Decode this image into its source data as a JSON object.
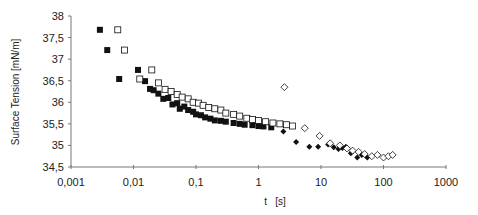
{
  "chart_data": {
    "type": "scatter",
    "title": "",
    "xlabel": "t   [s]",
    "ylabel": "Surface Tension [mN/m]",
    "xscale": "log",
    "xlim": [
      0.001,
      1000
    ],
    "ylim": [
      34.5,
      38
    ],
    "x_ticks": [
      "0,001",
      "0,01",
      "0,1",
      "1",
      "10",
      "100",
      "1000"
    ],
    "x_tick_values": [
      0.001,
      0.01,
      0.1,
      1,
      10,
      100,
      1000
    ],
    "y_ticks": [
      "34,5",
      "35",
      "35,5",
      "36",
      "36,5",
      "37",
      "37,5",
      "38"
    ],
    "y_tick_values": [
      34.5,
      35,
      35.5,
      36,
      36.5,
      37,
      37.5,
      38
    ],
    "grid": false,
    "legend": null,
    "series": [
      {
        "name": "filled-squares",
        "marker": "square-filled",
        "color": "#111111",
        "points": [
          [
            0.0029,
            37.68
          ],
          [
            0.0038,
            37.21
          ],
          [
            0.0059,
            36.54
          ],
          [
            0.0118,
            36.75
          ],
          [
            0.0153,
            36.49
          ],
          [
            0.0184,
            36.31
          ],
          [
            0.021,
            36.28
          ],
          [
            0.025,
            36.2
          ],
          [
            0.03,
            36.08
          ],
          [
            0.036,
            36.1
          ],
          [
            0.042,
            35.95
          ],
          [
            0.05,
            35.98
          ],
          [
            0.055,
            35.85
          ],
          [
            0.065,
            35.9
          ],
          [
            0.075,
            35.82
          ],
          [
            0.09,
            35.78
          ],
          [
            0.1,
            35.72
          ],
          [
            0.12,
            35.7
          ],
          [
            0.14,
            35.65
          ],
          [
            0.17,
            35.62
          ],
          [
            0.2,
            35.58
          ],
          [
            0.25,
            35.57
          ],
          [
            0.3,
            35.55
          ],
          [
            0.4,
            35.52
          ],
          [
            0.5,
            35.5
          ],
          [
            0.6,
            35.48
          ],
          [
            0.8,
            35.47
          ],
          [
            1.0,
            35.45
          ],
          [
            1.2,
            35.44
          ],
          [
            1.6,
            35.42
          ]
        ]
      },
      {
        "name": "open-squares",
        "marker": "square-open",
        "color": "#111111",
        "points": [
          [
            0.0056,
            37.68
          ],
          [
            0.0072,
            37.21
          ],
          [
            0.0126,
            36.54
          ],
          [
            0.0196,
            36.75
          ],
          [
            0.025,
            36.45
          ],
          [
            0.032,
            36.3
          ],
          [
            0.04,
            36.25
          ],
          [
            0.05,
            36.18
          ],
          [
            0.06,
            36.12
          ],
          [
            0.075,
            36.08
          ],
          [
            0.09,
            36.0
          ],
          [
            0.11,
            35.98
          ],
          [
            0.13,
            35.93
          ],
          [
            0.16,
            35.88
          ],
          [
            0.2,
            35.85
          ],
          [
            0.25,
            35.82
          ],
          [
            0.3,
            35.75
          ],
          [
            0.4,
            35.72
          ],
          [
            0.5,
            35.68
          ],
          [
            0.65,
            35.63
          ],
          [
            0.8,
            35.6
          ],
          [
            1.0,
            35.58
          ],
          [
            1.3,
            35.55
          ],
          [
            1.7,
            35.52
          ],
          [
            2.2,
            35.5
          ],
          [
            2.8,
            35.48
          ],
          [
            3.5,
            35.45
          ]
        ]
      },
      {
        "name": "filled-diamonds",
        "marker": "diamond-filled",
        "color": "#111111",
        "points": [
          [
            2.5,
            35.32
          ],
          [
            4.0,
            35.08
          ],
          [
            6.5,
            34.97
          ],
          [
            9.0,
            34.97
          ],
          [
            13,
            35.02
          ],
          [
            16,
            34.96
          ],
          [
            19,
            34.92
          ],
          [
            22,
            34.94
          ],
          [
            25,
            34.97
          ],
          [
            30,
            34.82
          ],
          [
            38,
            34.72
          ],
          [
            45,
            34.78
          ],
          [
            55,
            34.72
          ]
        ]
      },
      {
        "name": "open-diamonds",
        "marker": "diamond-open",
        "color": "#111111",
        "points": [
          [
            2.6,
            36.35
          ],
          [
            5.5,
            35.4
          ],
          [
            9.5,
            35.22
          ],
          [
            14,
            35.05
          ],
          [
            20,
            35.0
          ],
          [
            26,
            34.93
          ],
          [
            32,
            34.88
          ],
          [
            40,
            34.85
          ],
          [
            50,
            34.8
          ],
          [
            65,
            34.75
          ],
          [
            80,
            34.78
          ],
          [
            100,
            34.72
          ],
          [
            120,
            34.75
          ],
          [
            140,
            34.78
          ]
        ]
      }
    ]
  }
}
